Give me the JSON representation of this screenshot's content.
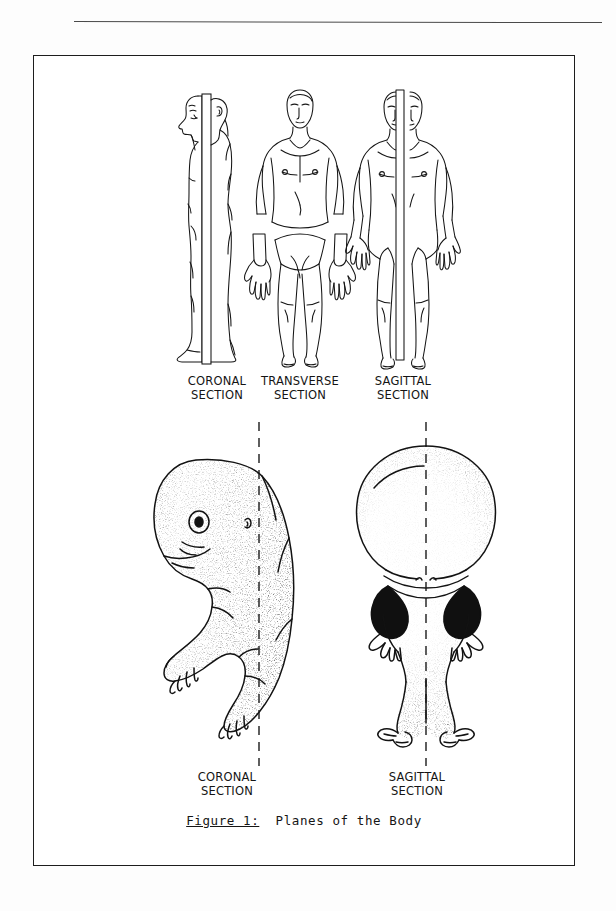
{
  "page": {
    "background_color": "#fdfdfd",
    "ink_color": "#141414",
    "rule_color": "#4a4a4a",
    "frame_color": "#1d1d1d"
  },
  "figure": {
    "caption_key": "Figure 1:",
    "caption_text": "  Planes of the Body",
    "adult_row": [
      {
        "id": "coronal",
        "label_line1": "CORONAL",
        "label_line2": "SECTION",
        "view": "lateral-view-adult-male-split-by-coronal-plane",
        "plane_style": "solid-sheet"
      },
      {
        "id": "transverse",
        "label_line1": "TRANSVERSE",
        "label_line2": "SECTION",
        "view": "anterior-view-adult-male-split-by-transverse-plane",
        "plane_style": "horizontal-gap"
      },
      {
        "id": "sagittal",
        "label_line1": "SAGITTAL",
        "label_line2": "SECTION",
        "view": "anterior-view-adult-male-split-by-sagittal-plane",
        "plane_style": "solid-sheet"
      }
    ],
    "fetus_row": [
      {
        "id": "coronal",
        "label_line1": "CORONAL",
        "label_line2": "SECTION",
        "view": "lateral-view-fetus-stippled",
        "plane_style": "dashed-line"
      },
      {
        "id": "sagittal",
        "label_line1": "SAGITTAL",
        "label_line2": "SECTION",
        "view": "anterior-view-fetus-stippled",
        "plane_style": "dashed-line"
      }
    ]
  }
}
